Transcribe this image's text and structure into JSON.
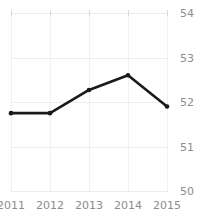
{
  "chart_data": {
    "type": "line",
    "title": "Freedom Trend",
    "title_cropped": true,
    "xlabel": "",
    "ylabel": "",
    "categories": [
      "2011",
      "2012",
      "2013",
      "2014",
      "2015"
    ],
    "x_tick_labels": [
      "2011",
      "2012",
      "2013",
      "2014",
      "2015"
    ],
    "y_tick_labels": [
      "54",
      "53",
      "52",
      "51",
      "50"
    ],
    "y_ticks": [
      54,
      53,
      52,
      51,
      50
    ],
    "ylim": [
      50,
      54
    ],
    "grid": true,
    "grid_axis": "both",
    "legend": false,
    "legend_position": "none",
    "series": [
      {
        "name": "Freedom Trend",
        "values": [
          51.75,
          51.75,
          52.27,
          52.6,
          51.9
        ],
        "marker": "circle",
        "color": "#1a1a1a",
        "line_width": 2.6
      }
    ]
  },
  "style": {
    "background": "#ffffff",
    "line_color": "#1a1a1a",
    "gridline_color": "#ececec",
    "tick_label_color": "#8c8c8c",
    "title_color": "#3a3a3a"
  }
}
